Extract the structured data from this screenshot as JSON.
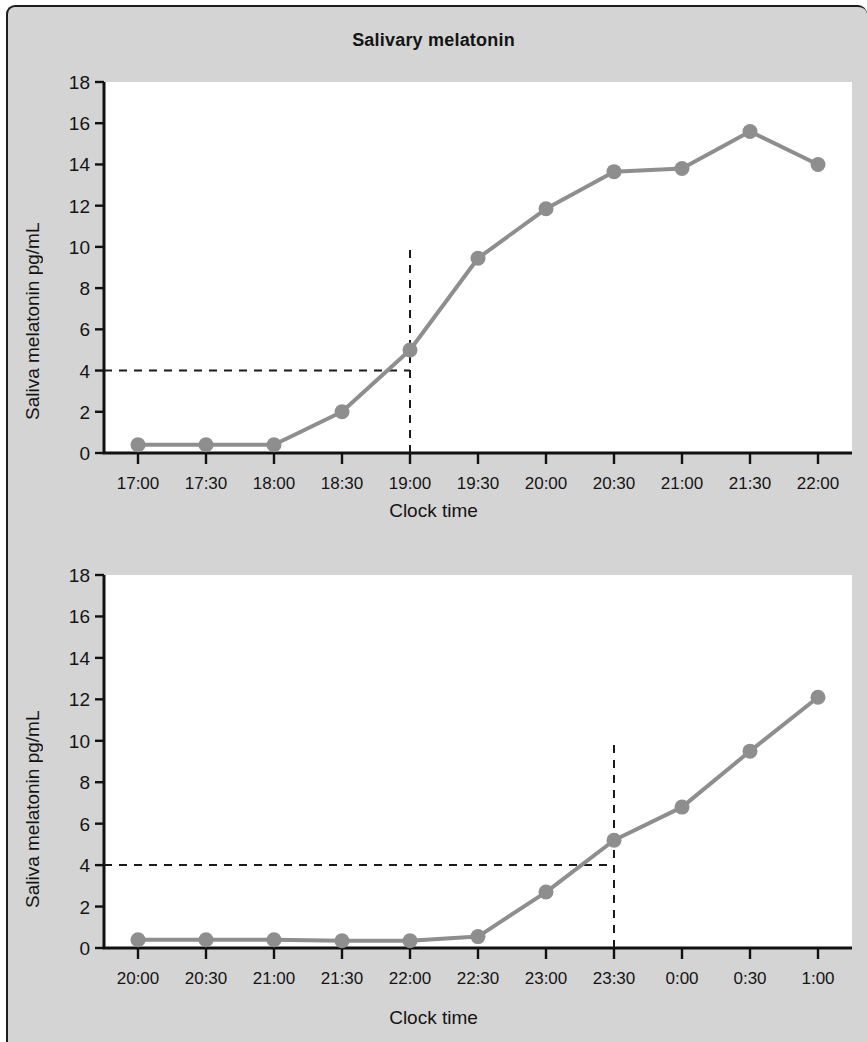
{
  "figure": {
    "title": "Salivary melatonin",
    "background_color": "#d4d4d4",
    "plot_background_color": "#ffffff",
    "series_color": "#8e8e8e",
    "axis_color": "#111111"
  },
  "panels": [
    {
      "id": "panel-top",
      "ylabel": "Saliva melatonin pg/mL",
      "xlabel": "Clock time",
      "yticks": [
        "0",
        "2",
        "4",
        "6",
        "8",
        "10",
        "12",
        "14",
        "16",
        "18"
      ],
      "xticks": [
        "17:00",
        "17:30",
        "18:00",
        "18:30",
        "19:00",
        "19:30",
        "20:00",
        "20:30",
        "21:00",
        "21:30",
        "22:00"
      ],
      "threshold_value": 4,
      "onset_time": "19:00"
    },
    {
      "id": "panel-bottom",
      "ylabel": "Saliva melatonin pg/mL",
      "xlabel": "Clock time",
      "yticks": [
        "0",
        "2",
        "4",
        "6",
        "8",
        "10",
        "12",
        "14",
        "16",
        "18"
      ],
      "xticks": [
        "20:00",
        "20:30",
        "21:00",
        "21:30",
        "22:00",
        "22:30",
        "23:00",
        "23:30",
        "0:00",
        "0:30",
        "1:00"
      ],
      "threshold_value": 4,
      "onset_time": "23:30"
    }
  ],
  "chart_data": [
    {
      "type": "line",
      "title": "Salivary melatonin",
      "panel": "top",
      "xlabel": "Clock time",
      "ylabel": "Saliva melatonin pg/mL",
      "x": [
        "17:00",
        "17:30",
        "18:00",
        "18:30",
        "19:00",
        "19:30",
        "20:00",
        "20:30",
        "21:00",
        "21:30",
        "22:00"
      ],
      "values": [
        0.4,
        0.4,
        0.4,
        2.0,
        5.0,
        9.45,
        11.85,
        13.65,
        13.8,
        15.6,
        14.0
      ],
      "ylim": [
        0,
        18
      ],
      "ytick_values": [
        0,
        2,
        4,
        6,
        8,
        10,
        12,
        14,
        16,
        18
      ],
      "grid": false,
      "legend": "none",
      "annotations": [
        {
          "kind": "horizontal-dashed-threshold",
          "y": 4,
          "label": "4 pg/mL threshold",
          "extends_to_x": "19:00"
        },
        {
          "kind": "vertical-dashed-onset",
          "x": "19:00",
          "label": "melatonin onset",
          "from_y": 0,
          "to_y": 10
        }
      ]
    },
    {
      "type": "line",
      "title": "Salivary melatonin",
      "panel": "bottom",
      "xlabel": "Clock time",
      "ylabel": "Saliva melatonin pg/mL",
      "x": [
        "20:00",
        "20:30",
        "21:00",
        "21:30",
        "22:00",
        "22:30",
        "23:00",
        "23:30",
        "0:00",
        "0:30",
        "1:00"
      ],
      "values": [
        0.4,
        0.4,
        0.4,
        0.35,
        0.35,
        0.55,
        2.7,
        5.2,
        6.8,
        9.5,
        12.1
      ],
      "ylim": [
        0,
        18
      ],
      "ytick_values": [
        0,
        2,
        4,
        6,
        8,
        10,
        12,
        14,
        16,
        18
      ],
      "grid": false,
      "legend": "none",
      "annotations": [
        {
          "kind": "horizontal-dashed-threshold",
          "y": 4,
          "label": "4 pg/mL threshold",
          "extends_to_x": "23:30"
        },
        {
          "kind": "vertical-dashed-onset",
          "x": "23:30",
          "label": "melatonin onset",
          "from_y": 0,
          "to_y": 10
        }
      ]
    }
  ]
}
